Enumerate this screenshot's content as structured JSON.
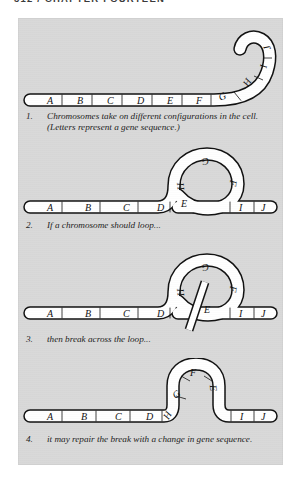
{
  "running_head": "312 / CHAPTER FOURTEEN",
  "figure": {
    "background_color": "#d9d9d9",
    "ink_color": "#111111",
    "chromosome_fill": "#ffffff",
    "steps": [
      {
        "number": "1.",
        "caption": "Chromosomes take on different configurations in the cell. (Letters represent a gene sequence.)",
        "gene_labels": [
          "A",
          "B",
          "C",
          "D",
          "E",
          "F",
          "G",
          "H",
          "I",
          "J"
        ],
        "shape": "bent-rod-with-hook"
      },
      {
        "number": "2.",
        "caption": "If a chromosome should loop...",
        "gene_labels": [
          "A",
          "B",
          "C",
          "D",
          "E",
          "F",
          "G",
          "H",
          "I",
          "J"
        ],
        "bar_labels": [
          "A",
          "B",
          "C",
          "D",
          "E",
          "I",
          "J"
        ],
        "loop_labels": [
          "G",
          "H",
          "F",
          "E"
        ],
        "shape": "rod-with-loop"
      },
      {
        "number": "3.",
        "caption": "then break across the loop...",
        "gene_labels": [
          "A",
          "B",
          "C",
          "D",
          "E",
          "F",
          "G",
          "H",
          "I",
          "J"
        ],
        "bar_labels": [
          "A",
          "B",
          "C",
          "D",
          "I",
          "J"
        ],
        "loop_labels": [
          "G",
          "H",
          "F",
          "E"
        ],
        "shape": "rod-with-loop-and-break"
      },
      {
        "number": "4.",
        "caption": "it may repair the break with a change in gene sequence.",
        "gene_labels": [
          "A",
          "B",
          "C",
          "D",
          "H",
          "G",
          "F",
          "E",
          "I",
          "J"
        ],
        "bar_labels": [
          "A",
          "B",
          "C",
          "D",
          "I",
          "J"
        ],
        "arch_labels": [
          "H",
          "G",
          "F",
          "E"
        ],
        "shape": "rod-with-arch"
      }
    ]
  }
}
